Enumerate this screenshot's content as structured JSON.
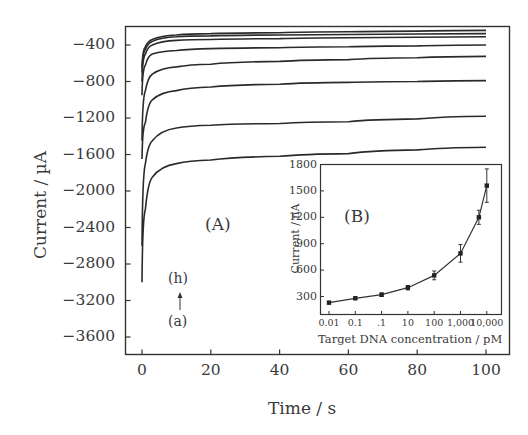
{
  "chart_data": [
    {
      "panel": "(A)",
      "type": "line",
      "title": "",
      "xlabel": "Time / s",
      "ylabel": "Current / µA",
      "xlim": [
        -5,
        107
      ],
      "ylim": [
        -3800,
        -190
      ],
      "x_ticks": [
        0,
        20,
        40,
        60,
        80,
        100
      ],
      "y_ticks": [
        -400,
        -800,
        -1200,
        -1600,
        -2000,
        -2400,
        -2800,
        -3200,
        -3600
      ],
      "grid": false,
      "legend": null,
      "annotations": [
        "(A)",
        "(h)",
        "↑",
        "(a)"
      ],
      "series": [
        {
          "name": "(a)",
          "start": -3000,
          "min": -3000,
          "t_values": [
            0,
            1,
            3,
            10,
            20,
            40,
            60,
            80,
            100
          ],
          "values": [
            -3000,
            -2200,
            -1850,
            -1700,
            -1660,
            -1620,
            -1590,
            -1550,
            -1520
          ]
        },
        {
          "name": "(b)",
          "start": -2600,
          "min": -2600,
          "t_values": [
            0,
            1,
            3,
            10,
            20,
            40,
            60,
            80,
            100
          ],
          "values": [
            -2600,
            -1700,
            -1450,
            -1310,
            -1280,
            -1260,
            -1240,
            -1210,
            -1180
          ]
        },
        {
          "name": "(c)",
          "start": -1650,
          "min": -1650,
          "t_values": [
            0,
            1,
            3,
            10,
            20,
            40,
            60,
            80,
            100
          ],
          "values": [
            -1650,
            -1250,
            -1000,
            -900,
            -860,
            -830,
            -810,
            -800,
            -790
          ]
        },
        {
          "name": "(d)",
          "start": -1450,
          "min": -1450,
          "t_values": [
            0,
            1,
            3,
            10,
            20,
            40,
            60,
            80,
            100
          ],
          "values": [
            -1450,
            -900,
            -720,
            -640,
            -610,
            -580,
            -560,
            -540,
            -525
          ]
        },
        {
          "name": "(e)",
          "start": -950,
          "min": -950,
          "t_values": [
            0,
            1,
            3,
            10,
            20,
            40,
            60,
            80,
            100
          ],
          "values": [
            -950,
            -620,
            -500,
            -460,
            -440,
            -430,
            -420,
            -410,
            -400
          ]
        },
        {
          "name": "(f)",
          "start": -800,
          "min": -800,
          "t_values": [
            0,
            1,
            3,
            10,
            20,
            40,
            60,
            80,
            100
          ],
          "values": [
            -800,
            -500,
            -400,
            -350,
            -340,
            -330,
            -320,
            -315,
            -310
          ]
        },
        {
          "name": "(g)",
          "start": -700,
          "min": -700,
          "t_values": [
            0,
            1,
            3,
            10,
            20,
            40,
            60,
            80,
            100
          ],
          "values": [
            -700,
            -450,
            -360,
            -310,
            -300,
            -290,
            -285,
            -280,
            -275
          ]
        },
        {
          "name": "(h)",
          "start": -650,
          "min": -650,
          "t_values": [
            0,
            1,
            3,
            10,
            20,
            40,
            60,
            80,
            100
          ],
          "values": [
            -650,
            -420,
            -340,
            -290,
            -275,
            -265,
            -255,
            -248,
            -240
          ]
        }
      ]
    },
    {
      "panel": "(B)",
      "type": "line",
      "title": "",
      "xlabel": "Target DNA concentration / pM",
      "ylabel": "Current / nA",
      "x_scale": "log",
      "x_tick_labels": [
        "0.01",
        "0.1",
        ".1",
        "10",
        "100",
        "1,000",
        "10,000"
      ],
      "x": [
        0.01,
        0.1,
        1,
        10,
        100,
        1000,
        5000,
        10000
      ],
      "values": [
        230,
        280,
        320,
        400,
        540,
        790,
        1200,
        1560
      ],
      "error": [
        15,
        15,
        20,
        25,
        50,
        100,
        80,
        190
      ],
      "y_ticks": [
        300,
        600,
        900,
        1200,
        1500,
        1800
      ],
      "ylim": [
        120,
        1800
      ],
      "grid": false,
      "annotations": [
        "(B)"
      ]
    }
  ],
  "main": {
    "ylabel": "Current / µA",
    "xlabel": "Time / s",
    "panel_label": "(A)",
    "arrow_top": "(h)",
    "arrow_bottom": "(a)",
    "y_ticks": [
      "-400",
      "-800",
      "-1200",
      "-1600",
      "-2000",
      "-2400",
      "-2800",
      "-3200",
      "-3600"
    ],
    "x_ticks": [
      "0",
      "20",
      "40",
      "60",
      "80",
      "100"
    ]
  },
  "inset": {
    "ylabel": "Current / nA",
    "xlabel": "Target DNA concentration / pM",
    "panel_label": "(B)",
    "y_ticks": [
      "1800",
      "1500",
      "1200",
      "900",
      "600",
      "300"
    ],
    "x_ticks": [
      "0.01",
      "0.1",
      ".1",
      "10",
      "100",
      "1,000",
      "10,000"
    ]
  }
}
